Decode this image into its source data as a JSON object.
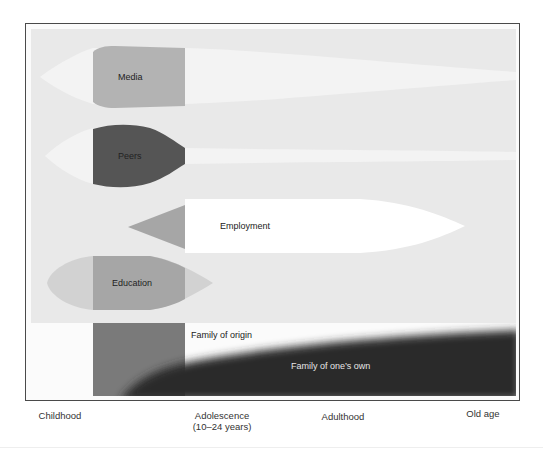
{
  "diagram": {
    "streams": [
      {
        "id": "media",
        "label": "Media",
        "color": "#b3b3b3",
        "trail_color": "#f1f1f1"
      },
      {
        "id": "peers",
        "label": "Peers",
        "color": "#555555",
        "trail_color": "#f1f1f1"
      },
      {
        "id": "employment",
        "label": "Employment",
        "color": "#ffffff",
        "lead_color": "#a6a6a6"
      },
      {
        "id": "education",
        "label": "Education",
        "color": "#a6a6a6",
        "lead_color": "#cfcfcf"
      }
    ],
    "family": {
      "origin_label": "Family of origin",
      "own_label": "Family of one’s own",
      "origin_block_color": "#7a7a7a",
      "own_color": "#2e2e2e"
    },
    "panel_color": "#e9e9e9",
    "border_color": "#4a4a4a"
  },
  "axis": {
    "stages": [
      {
        "label": "Childhood",
        "sub": ""
      },
      {
        "label": "Adolescence",
        "sub": "(10–24 years)"
      },
      {
        "label": "Adulthood",
        "sub": ""
      },
      {
        "label": "Old age",
        "sub": ""
      }
    ]
  }
}
